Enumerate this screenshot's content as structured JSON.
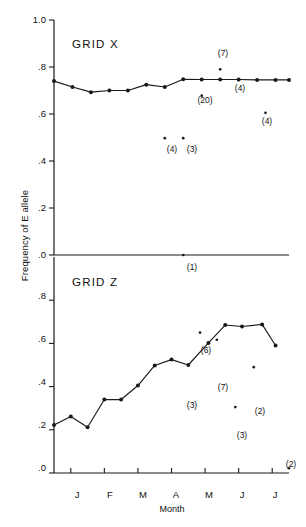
{
  "figure": {
    "ylabel": "Frequency of E allele",
    "xlabel": "Month"
  },
  "panels": {
    "top": {
      "title": "GRID X"
    },
    "bottom": {
      "title": "GRID Z"
    }
  },
  "axes": {
    "y_ticks_top": [
      "1.0",
      ".8",
      ".6",
      ".4",
      ".2",
      ".0"
    ],
    "y_ticks_bottom": [
      "1.0",
      ".8",
      ".6",
      ".4",
      ".2",
      ".0"
    ],
    "x_ticks": [
      "J",
      "F",
      "M",
      "A",
      "M",
      "J",
      "J"
    ]
  },
  "annotations": {
    "top": [
      "(7)",
      "(20)",
      "(4)",
      "(4)",
      "(4)",
      "(3)",
      "(1)"
    ],
    "bottom": [
      "(6)",
      "(7)",
      "(3)",
      "(2)",
      "(3)",
      "(2)"
    ]
  },
  "chart_data": {
    "type": "line",
    "xlabel": "Month",
    "ylabel": "Frequency of E allele",
    "grid": false,
    "legend": "none",
    "panels": [
      {
        "name": "GRID X",
        "ylim": [
          0.0,
          1.0
        ],
        "ytick_values": [
          1.0,
          0.8,
          0.6,
          0.4,
          0.2,
          0.0
        ],
        "ytick_labels": [
          "1.0",
          ".8",
          ".6",
          ".4",
          ".2",
          ".0"
        ],
        "xtick_labels": [
          "J",
          "F",
          "M",
          "A",
          "M",
          "J",
          "J"
        ],
        "series": [
          {
            "name": "GRID X connected line",
            "marker": "filled-circle",
            "x": [
              0.0,
              0.55,
              1.1,
              1.65,
              2.2,
              2.75,
              3.3,
              3.85,
              4.4,
              4.95,
              5.5,
              6.05,
              6.6,
              7.0
            ],
            "y": [
              0.74,
              0.715,
              0.693,
              0.7,
              0.7,
              0.725,
              0.715,
              0.748,
              0.747,
              0.747,
              0.747,
              0.745,
              0.745,
              0.745
            ]
          }
        ],
        "isolated_points": [
          {
            "x": 4.95,
            "y": 0.79,
            "label": "(7)",
            "label_pos": "above"
          },
          {
            "x": 4.4,
            "y": 0.678,
            "label": "(20)",
            "label_pos": "below"
          },
          {
            "x": 5.5,
            "y": 0.745,
            "label": "(4)",
            "label_pos": "below"
          },
          {
            "x": 6.3,
            "y": 0.605,
            "label": "(4)",
            "label_pos": "below"
          },
          {
            "x": 3.3,
            "y": 0.497,
            "label": "(4)",
            "label_pos": "below"
          },
          {
            "x": 3.85,
            "y": 0.497,
            "label": "(3)",
            "label_pos": "below"
          },
          {
            "x": 3.85,
            "y": 0.0,
            "label": "(1)",
            "label_pos": "below"
          }
        ]
      },
      {
        "name": "GRID Z",
        "ylim": [
          0.0,
          1.0
        ],
        "ytick_values": [
          1.0,
          0.8,
          0.6,
          0.4,
          0.2,
          0.0
        ],
        "ytick_labels": [
          "1.0",
          ".8",
          ".6",
          ".4",
          ".2",
          ".0"
        ],
        "xtick_labels": [
          "J",
          "F",
          "M",
          "A",
          "M",
          "J",
          "J"
        ],
        "series": [
          {
            "name": "GRID Z connected line",
            "marker": "filled-circle",
            "x": [
              0.0,
              0.5,
              1.0,
              1.5,
              2.0,
              2.5,
              3.0,
              3.5,
              4.0,
              4.6,
              5.1,
              5.6,
              6.2,
              6.6
            ],
            "y": [
              0.222,
              0.262,
              0.212,
              0.34,
              0.34,
              0.405,
              0.498,
              0.525,
              0.5,
              0.602,
              0.685,
              0.678,
              0.688,
              0.59
            ]
          }
        ],
        "isolated_points": [
          {
            "x": 4.35,
            "y": 0.65,
            "label": "(6)",
            "label_pos": "above"
          },
          {
            "x": 4.85,
            "y": 0.617,
            "label": "(7)",
            "label_pos": "below"
          },
          {
            "x": 4.0,
            "y": 0.5,
            "label": "(3)",
            "label_pos": "below"
          },
          {
            "x": 5.95,
            "y": 0.49,
            "label": "(2)",
            "label_pos": "below"
          },
          {
            "x": 5.4,
            "y": 0.305,
            "label": "(3)",
            "label_pos": "below"
          },
          {
            "x": 7.0,
            "y": 0.022,
            "label": "(2)",
            "label_pos": "above-right"
          }
        ]
      }
    ]
  }
}
